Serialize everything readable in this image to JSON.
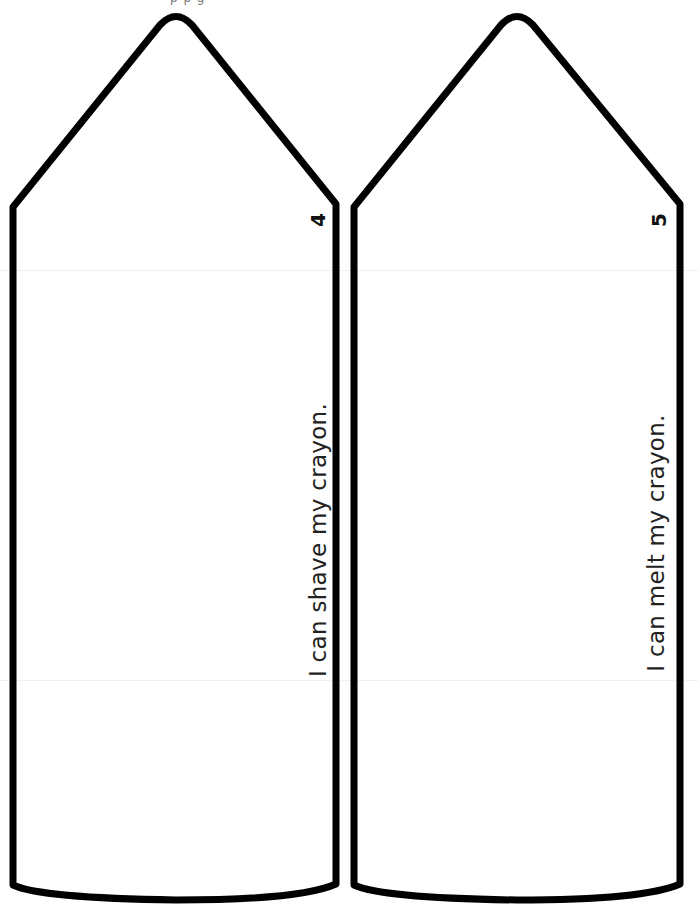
{
  "page": {
    "header_clipped": "p p g"
  },
  "crayons": [
    {
      "page_number": "4",
      "caption": "I can shave my crayon."
    },
    {
      "page_number": "5",
      "caption": "I can melt my crayon."
    }
  ],
  "colors": {
    "outline": "#000000",
    "background": "#ffffff",
    "text": "#222222"
  }
}
